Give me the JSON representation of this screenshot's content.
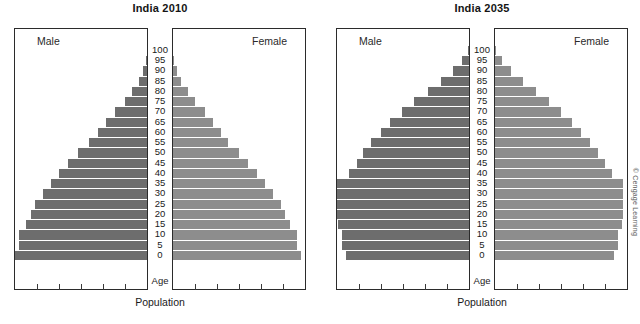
{
  "figure": {
    "axis_caption": "Population",
    "age_caption": "Age",
    "male_label": "Male",
    "female_label": "Female",
    "credit": "© Cengage Learning",
    "bar_color_male": "#6d6d6d",
    "bar_color_female": "#8d8d8d",
    "frame_color": "#2b2b2b"
  },
  "chart_data": [
    {
      "type": "bar",
      "title": "India 2010",
      "subtype": "population-pyramid",
      "xlabel": "Population",
      "ylabel": "Age",
      "grid": false,
      "legend": [
        "Male",
        "Female"
      ],
      "legend_position": "inside-top-corners",
      "xtick_count": 5,
      "categories": [
        "0",
        "5",
        "10",
        "15",
        "20",
        "25",
        "30",
        "35",
        "40",
        "45",
        "50",
        "55",
        "60",
        "65",
        "70",
        "75",
        "80",
        "85",
        "90",
        "95",
        "100"
      ],
      "series": [
        {
          "name": "Male",
          "direction": "left",
          "values": [
            100,
            97,
            97,
            92,
            88,
            85,
            79,
            73,
            67,
            60,
            52,
            44,
            37,
            31,
            24,
            17,
            11,
            6,
            3,
            1,
            0
          ]
        },
        {
          "name": "Female",
          "direction": "right",
          "values": [
            97,
            94,
            94,
            89,
            85,
            82,
            76,
            70,
            64,
            57,
            50,
            42,
            36,
            30,
            24,
            17,
            11,
            6,
            3,
            1,
            0
          ]
        }
      ]
    },
    {
      "type": "bar",
      "title": "India 2035",
      "subtype": "population-pyramid",
      "xlabel": "Population",
      "ylabel": "Age",
      "grid": false,
      "legend": [
        "Male",
        "Female"
      ],
      "legend_position": "inside-top-corners",
      "xtick_count": 5,
      "categories": [
        "0",
        "5",
        "10",
        "15",
        "20",
        "25",
        "30",
        "35",
        "40",
        "45",
        "50",
        "55",
        "60",
        "65",
        "70",
        "75",
        "80",
        "85",
        "90",
        "95",
        "100"
      ],
      "series": [
        {
          "name": "Male",
          "direction": "left",
          "values": [
            93,
            96,
            96,
            99,
            100,
            100,
            100,
            100,
            91,
            85,
            80,
            74,
            67,
            60,
            51,
            42,
            31,
            21,
            12,
            5,
            1
          ]
        },
        {
          "name": "Female",
          "direction": "right",
          "values": [
            90,
            93,
            93,
            96,
            97,
            97,
            97,
            97,
            89,
            83,
            78,
            72,
            65,
            58,
            50,
            41,
            31,
            21,
            12,
            5,
            1
          ]
        }
      ]
    }
  ]
}
